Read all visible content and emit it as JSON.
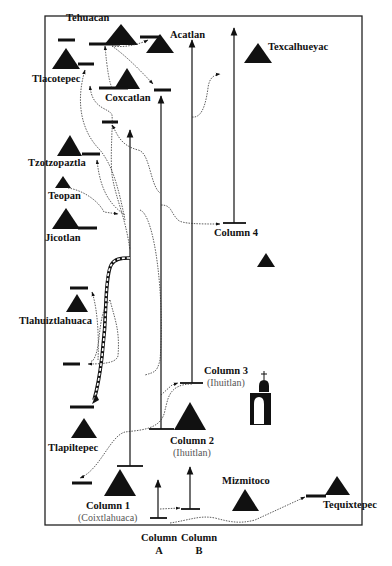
{
  "colors": {
    "ink": "#111111",
    "route": "#333333",
    "border": "#222222",
    "background": "#ffffff",
    "subtext": "#555555"
  },
  "frame": {
    "x": 45,
    "y": 16,
    "width": 317,
    "height": 509
  },
  "places": {
    "tehuacan": "Tehuacan",
    "acatlan": "Acatlan",
    "texcalhueyac": "Texcalhueyac",
    "tlacotepec": "Tlacotepec",
    "coxcatlan": "Coxcatlan",
    "tzotzopaztla": "Tzotzopaztla",
    "teopan": "Teopan",
    "jicotlan": "Jicotlan",
    "tlahuiztlahuaca": "Tlahuiztlahuaca",
    "tlapiltepec": "Tlapiltepec",
    "mizmitoco": "Mizmitoco",
    "tequixtepec": "Tequixtepec"
  },
  "columns": {
    "col4": {
      "label": "Column 4"
    },
    "col3": {
      "label": "Column 3",
      "sublabel": "(Ihuitlan)"
    },
    "col2": {
      "label": "Column 2",
      "sublabel": "(Ihuitlan)"
    },
    "col1": {
      "label": "Column 1",
      "sublabel": "(Coixtlahuaca)"
    },
    "colA": {
      "label": "Column",
      "letter": "A"
    },
    "colB": {
      "label": "Column",
      "letter": "B"
    }
  },
  "icons": {
    "hill": "hill-glyph-triangle",
    "church": "church-icon",
    "arrow": "arrowhead"
  }
}
